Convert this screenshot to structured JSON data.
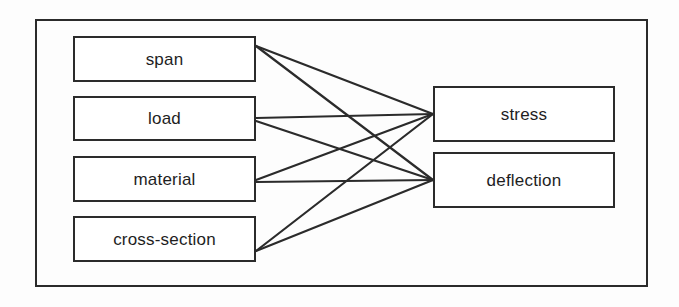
{
  "diagram": {
    "type": "bipartite-dependency-graph",
    "background_color": "#fdfdfd",
    "line_color": "#2b2b2b",
    "text_color": "#1e1e1e",
    "frame": {
      "x": 35,
      "y": 19,
      "width": 613,
      "height": 268
    },
    "inputs": [
      {
        "id": "span",
        "label": "span",
        "x": 73,
        "y": 36,
        "width": 183,
        "height": 46
      },
      {
        "id": "load",
        "label": "load",
        "x": 73,
        "y": 96,
        "width": 183,
        "height": 45
      },
      {
        "id": "material",
        "label": "material",
        "x": 73,
        "y": 156,
        "width": 183,
        "height": 46
      },
      {
        "id": "cross-section",
        "label": "cross-section",
        "x": 73,
        "y": 216,
        "width": 183,
        "height": 46
      }
    ],
    "outputs": [
      {
        "id": "stress",
        "label": "stress",
        "x": 433,
        "y": 86,
        "width": 182,
        "height": 56
      },
      {
        "id": "deflection",
        "label": "deflection",
        "x": 433,
        "y": 152,
        "width": 182,
        "height": 56
      }
    ],
    "edges": [
      {
        "from": "span",
        "to": "stress",
        "x1": 256,
        "y1": 46,
        "x2": 433,
        "y2": 114
      },
      {
        "from": "span",
        "to": "deflection",
        "x1": 256,
        "y1": 46,
        "x2": 433,
        "y2": 180
      },
      {
        "from": "load",
        "to": "stress",
        "x1": 256,
        "y1": 118,
        "x2": 433,
        "y2": 114
      },
      {
        "from": "load",
        "to": "deflection",
        "x1": 256,
        "y1": 121,
        "x2": 433,
        "y2": 180
      },
      {
        "from": "material",
        "to": "stress",
        "x1": 256,
        "y1": 180,
        "x2": 433,
        "y2": 114
      },
      {
        "from": "material",
        "to": "deflection",
        "x1": 256,
        "y1": 182,
        "x2": 433,
        "y2": 180
      },
      {
        "from": "cross-section",
        "to": "stress",
        "x1": 256,
        "y1": 251,
        "x2": 433,
        "y2": 114
      },
      {
        "from": "cross-section",
        "to": "deflection",
        "x1": 256,
        "y1": 251,
        "x2": 433,
        "y2": 180
      }
    ]
  }
}
